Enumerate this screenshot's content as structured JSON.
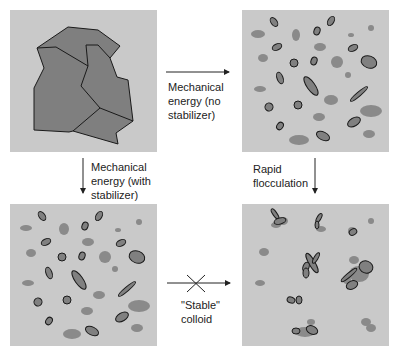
{
  "colors": {
    "background": "#ffffff",
    "panel": "#c9c9c9",
    "solid": "#7f7f7f",
    "particle": "#8a8a8a",
    "particle_outline": "#1a1a1a",
    "arrow": "#222222"
  },
  "panels": {
    "top_left": {
      "name": "solid-aggregate",
      "description": "Large solid piece with cracks"
    },
    "top_right": {
      "name": "dispersed-particles-unstable"
    },
    "bottom_left": {
      "name": "dispersed-particles-stabilized"
    },
    "bottom_right": {
      "name": "flocculated-particles"
    }
  },
  "arrows": {
    "mechanical_no_stabilizer": "Mechanical\nenergy (no\nstabilizer)",
    "mechanical_with_stabilizer": "Mechanical\nenergy (with\nstabilizer)",
    "rapid_flocculation": "Rapid\nflocculation",
    "stable_colloid": "\"Stable\"\ncolloid"
  }
}
